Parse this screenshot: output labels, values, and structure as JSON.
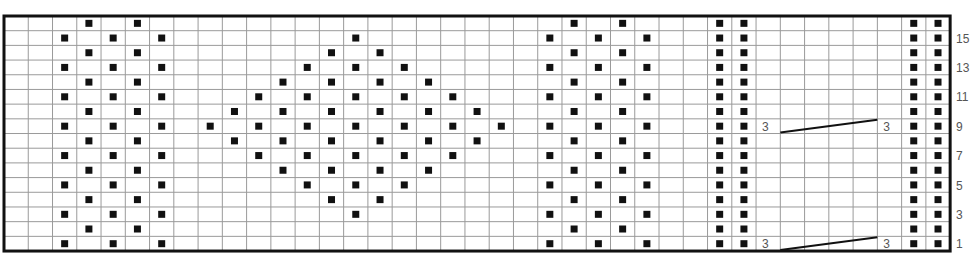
{
  "chart_title": "",
  "grid": {
    "columns": 39,
    "rows": 16,
    "cell_width": 24.26,
    "cell_height": 14.69,
    "line_color": "#9a9a9a",
    "border_color": "#111111",
    "dot_color": "#111111"
  },
  "row_labels": [
    {
      "row": 15,
      "label": "15"
    },
    {
      "row": 13,
      "label": "13"
    },
    {
      "row": 11,
      "label": "11"
    },
    {
      "row": 9,
      "label": "9"
    },
    {
      "row": 7,
      "label": "7"
    },
    {
      "row": 5,
      "label": "5"
    },
    {
      "row": 3,
      "label": "3"
    },
    {
      "row": 1,
      "label": "1"
    }
  ],
  "legend": {
    "dot": "purl stitch",
    "empty": "knit stitch",
    "cable": "3 over 3 cable cross"
  },
  "dots": {
    "left_block": {
      "odd_rows": [
        2,
        4,
        6
      ],
      "even_rows": [
        3,
        5
      ]
    },
    "right_block": {
      "odd_rows": [
        22,
        24,
        26
      ],
      "even_rows": [
        23,
        25
      ]
    },
    "rib_columns": [
      29,
      30,
      37,
      38
    ],
    "diamond": {
      "15": [
        14
      ],
      "14": [
        13,
        15
      ],
      "13": [
        12,
        14,
        16
      ],
      "12": [
        11,
        13,
        15,
        17
      ],
      "11": [
        10,
        12,
        14,
        16,
        18
      ],
      "10": [
        9,
        11,
        13,
        15,
        17,
        19
      ],
      "9": [
        8,
        10,
        12,
        14,
        16,
        18,
        20
      ],
      "8": [
        9,
        11,
        13,
        15,
        17,
        19
      ],
      "7": [
        10,
        12,
        14,
        16,
        18
      ],
      "6": [
        11,
        13,
        15,
        17
      ],
      "5": [
        12,
        14,
        16
      ],
      "4": [
        13,
        15
      ],
      "3": [
        14
      ]
    }
  },
  "cables": [
    {
      "row": 9,
      "left_label": "3",
      "right_label": "3",
      "label_cols": [
        31,
        36
      ],
      "span_cols": [
        32,
        35
      ]
    },
    {
      "row": 1,
      "left_label": "3",
      "right_label": "3",
      "label_cols": [
        31,
        36
      ],
      "span_cols": [
        32,
        35
      ]
    }
  ]
}
